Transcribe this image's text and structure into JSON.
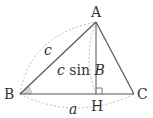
{
  "diagram": {
    "points": {
      "A": {
        "label": "A",
        "x": 96,
        "y": 22
      },
      "B": {
        "label": "B",
        "x": 20,
        "y": 94
      },
      "C": {
        "label": "C",
        "x": 134,
        "y": 94
      },
      "H": {
        "label": "H",
        "x": 96,
        "y": 94
      }
    },
    "side_labels": {
      "c": "c",
      "a": "a",
      "height_prefix": "c",
      "height_func": " sin ",
      "height_angle": "B"
    },
    "colors": {
      "lines": "#555555",
      "dashed": "#aaaaaa",
      "angle_fill": "#d0d0d0",
      "text": "#333333"
    }
  }
}
